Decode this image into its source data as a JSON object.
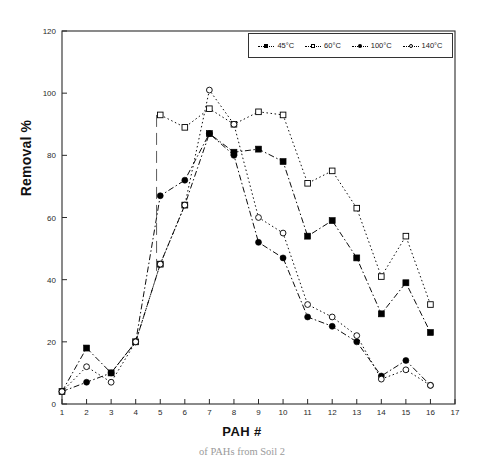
{
  "chart_data": {
    "type": "line",
    "title": "",
    "xlabel": "PAH #",
    "ylabel": "Removal %",
    "xlim": [
      1,
      17
    ],
    "ylim": [
      0,
      120
    ],
    "xticks": [
      "1",
      "2",
      "3",
      "4",
      "5",
      "6",
      "7",
      "8",
      "9",
      "10",
      "11",
      "12",
      "13",
      "14",
      "15",
      "16",
      "17"
    ],
    "yticks": [
      "0",
      "20",
      "40",
      "60",
      "80",
      "100",
      "120"
    ],
    "grid": false,
    "legend_position": "top-right",
    "x": [
      1,
      2,
      3,
      4,
      5,
      6,
      7,
      8,
      9,
      10,
      11,
      12,
      13,
      14,
      15,
      16
    ],
    "series": [
      {
        "name": "45°C",
        "marker": "filled-square",
        "line": "dash-dot",
        "x": [
          1,
          2,
          3,
          4,
          5,
          6,
          7,
          8,
          9,
          10,
          11,
          12,
          13,
          14,
          15,
          16
        ],
        "values": [
          4,
          18,
          10,
          20,
          45,
          64,
          87,
          81,
          82,
          78,
          54,
          59,
          47,
          29,
          39,
          23
        ]
      },
      {
        "name": "60°C",
        "marker": "open-square",
        "line": "dotted",
        "x": [
          5,
          6,
          7,
          8,
          9,
          10,
          11,
          12,
          13,
          14,
          15,
          16
        ],
        "values": [
          93,
          89,
          95,
          90,
          94,
          93,
          71,
          75,
          63,
          41,
          54,
          32
        ]
      },
      {
        "name": "100°C",
        "marker": "filled-circle",
        "line": "dash-dot",
        "x": [
          1,
          2,
          3,
          4,
          5,
          6,
          7,
          8,
          9,
          10,
          11,
          12,
          13,
          14,
          15,
          16
        ],
        "values": [
          4,
          7,
          10,
          20,
          67,
          72,
          87,
          80,
          52,
          47,
          28,
          25,
          20,
          9,
          14,
          6
        ]
      },
      {
        "name": "140°C",
        "marker": "open-circle",
        "line": "dotted",
        "x": [
          1,
          2,
          3,
          4,
          5,
          6,
          7,
          8,
          9,
          10,
          11,
          12,
          13,
          14,
          15,
          16
        ],
        "values": [
          4,
          12,
          7,
          20,
          45,
          64,
          101,
          90,
          60,
          55,
          32,
          28,
          22,
          8,
          11,
          6
        ]
      }
    ]
  },
  "axes": {
    "y_title": "Removal %",
    "x_title": "PAH #"
  },
  "legend": {
    "entries": [
      {
        "label": "45°C",
        "marker": "filled-square-icon"
      },
      {
        "label": "60°C",
        "marker": "open-square-icon"
      },
      {
        "label": "100°C",
        "marker": "filled-circle-icon"
      },
      {
        "label": "140°C",
        "marker": "open-circle-icon"
      }
    ]
  },
  "caption": {
    "text": "of PAHs from Soil 2"
  },
  "colors": {
    "ink": "#000000",
    "axis": "#1a1a1a",
    "background": "#ffffff"
  }
}
